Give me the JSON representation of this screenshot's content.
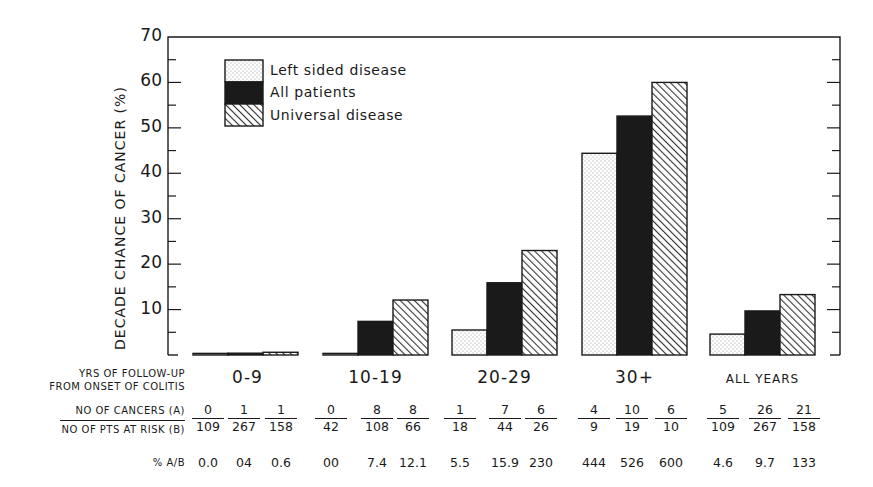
{
  "chart_data": {
    "type": "bar",
    "title": "",
    "ylabel": "DECADE CHANCE OF CANCER (%)",
    "xlabel": "YRS OF FOLLOW-UP FROM ONSET OF COLITIS",
    "ylim": [
      0,
      70
    ],
    "yticks": [
      10,
      20,
      30,
      40,
      50,
      60,
      70
    ],
    "ytick_labels": [
      "10",
      "20",
      "30",
      "40",
      "50",
      "60",
      "70"
    ],
    "grid": false,
    "legend_position": "upper-left",
    "categories": [
      "0-9",
      "10-19",
      "20-29",
      "30+",
      "ALL YEARS"
    ],
    "series": [
      {
        "name": "Left sided disease",
        "pattern": "dotted",
        "values": [
          0.0,
          0.0,
          5.5,
          44.4,
          4.6
        ]
      },
      {
        "name": "All patients",
        "pattern": "solid-black",
        "values": [
          0.4,
          7.4,
          15.9,
          52.6,
          9.7
        ]
      },
      {
        "name": "Universal disease",
        "pattern": "hatched",
        "values": [
          0.6,
          12.1,
          23.0,
          60.0,
          13.3
        ]
      }
    ],
    "table": {
      "row_labels": [
        "NO OF CANCERS (A)",
        "NO OF PTS AT RISK (B)",
        "% A/B"
      ],
      "groups": [
        {
          "category": "0-9",
          "cancers": [
            "0",
            "1",
            "1"
          ],
          "at_risk": [
            "109",
            "267",
            "158"
          ],
          "pct": [
            "0.0",
            "0.4",
            "0.6"
          ]
        },
        {
          "category": "10-19",
          "cancers": [
            "0",
            "8",
            "8"
          ],
          "at_risk": [
            "42",
            "108",
            "66"
          ],
          "pct": [
            "0.0",
            "7.4",
            "12.1"
          ]
        },
        {
          "category": "20-29",
          "cancers": [
            "1",
            "7",
            "6"
          ],
          "at_risk": [
            "18",
            "44",
            "26"
          ],
          "pct": [
            "5.5",
            "15.9",
            "23.0"
          ]
        },
        {
          "category": "30+",
          "cancers": [
            "4",
            "10",
            "6"
          ],
          "at_risk": [
            "9",
            "19",
            "10"
          ],
          "pct": [
            "44.4",
            "52.6",
            "60.0"
          ]
        },
        {
          "category": "ALL YEARS",
          "cancers": [
            "5",
            "26",
            "21"
          ],
          "at_risk": [
            "109",
            "267",
            "158"
          ],
          "pct": [
            "4.6",
            "9.7",
            "13.3"
          ]
        }
      ]
    }
  },
  "labels": {
    "ylabel": "DECADE CHANCE OF CANCER (%)",
    "yticks": [
      "70",
      "60",
      "50",
      "40",
      "30",
      "20",
      "10"
    ],
    "xlabel_line1": "YRS OF FOLLOW-UP",
    "xlabel_line2": "FROM ONSET OF COLITIS",
    "row_cancers": "NO OF CANCERS (A)",
    "row_at_risk": "NO OF PTS AT RISK (B)",
    "row_pct": "% A/B",
    "groups": [
      "0-9",
      "10-19",
      "20-29",
      "30+",
      "ALL YEARS"
    ]
  },
  "legend": [
    {
      "label": "Left sided disease"
    },
    {
      "label": "All patients"
    },
    {
      "label": "Universal disease"
    }
  ],
  "table_display": {
    "cancers": [
      [
        "0",
        "1",
        "1"
      ],
      [
        "0",
        "8",
        "8"
      ],
      [
        "1",
        "7",
        "6"
      ],
      [
        "4",
        "10",
        "6"
      ],
      [
        "5",
        "26",
        "21"
      ]
    ],
    "at_risk": [
      [
        "109",
        "267",
        "158"
      ],
      [
        "42",
        "108",
        "66"
      ],
      [
        "18",
        "44",
        "26"
      ],
      [
        "9",
        "19",
        "10"
      ],
      [
        "109",
        "267",
        "158"
      ]
    ],
    "pct": [
      [
        "0.0",
        "04",
        "0.6"
      ],
      [
        "00",
        "7.4",
        "12.1"
      ],
      [
        "5.5",
        "15.9",
        "230"
      ],
      [
        "444",
        "526",
        "600"
      ],
      [
        "4.6",
        "9.7",
        "133"
      ]
    ]
  },
  "colors": {
    "ink": "#1a1a1a",
    "background": "#ffffff",
    "dots": "#8a8a8a"
  }
}
